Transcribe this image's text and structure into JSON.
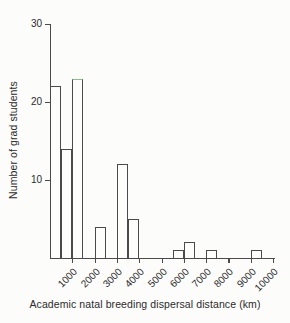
{
  "figure": {
    "background": "#fcfcfb",
    "axis_color": "#4a4a4a",
    "text_color": "#2b2b2b",
    "bar_fill": "#fdfdfc",
    "bar_border_color": "#4a4a4a"
  },
  "chart_data": {
    "type": "bar",
    "title": "",
    "xlabel": "Academic natal breeding dispersal distance (km)",
    "ylabel": "Number of grad students",
    "x_ticks": [
      1000,
      2000,
      3000,
      4000,
      5000,
      6000,
      7000,
      8000,
      9000,
      10000
    ],
    "x_tick_labels": [
      "1000",
      "2000",
      "3000",
      "4000",
      "5000",
      "6000",
      "7000",
      "8000",
      "9000",
      "10000"
    ],
    "y_ticks": [
      10,
      20,
      30
    ],
    "y_tick_labels": [
      "10",
      "20",
      "30"
    ],
    "xlim": [
      0,
      10100
    ],
    "ylim": [
      0,
      30
    ],
    "grid": false,
    "legend": "none",
    "bar_style": "open-outline-histogram",
    "bins": [
      {
        "start_km": 0,
        "end_km": 500,
        "count": 22
      },
      {
        "start_km": 500,
        "end_km": 1000,
        "count": 14
      },
      {
        "start_km": 1000,
        "end_km": 1500,
        "count": 23,
        "top_edge_color": "#8abf8a"
      },
      {
        "start_km": 2000,
        "end_km": 2500,
        "count": 4
      },
      {
        "start_km": 3000,
        "end_km": 3500,
        "count": 12
      },
      {
        "start_km": 3500,
        "end_km": 4000,
        "count": 5
      },
      {
        "start_km": 5500,
        "end_km": 6000,
        "count": 1
      },
      {
        "start_km": 6000,
        "end_km": 6500,
        "count": 2
      },
      {
        "start_km": 7000,
        "end_km": 7500,
        "count": 1
      },
      {
        "start_km": 9000,
        "end_km": 9500,
        "count": 1
      }
    ]
  }
}
